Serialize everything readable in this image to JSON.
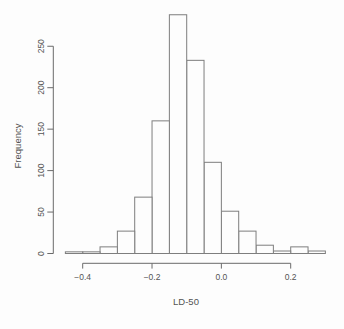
{
  "figure": {
    "background": "#fdfdfd",
    "axis_color": "#6a6a6a",
    "text_color": "#545454",
    "bar_fill": "#fdfdfd",
    "bar_stroke": "#7e7e7e"
  },
  "chart_data": {
    "type": "bar",
    "subtype": "histogram",
    "title": "",
    "xlabel": "LD-50",
    "ylabel": "Frequency",
    "bin_start": -0.45,
    "bin_width": 0.05,
    "bin_edges": [
      -0.45,
      -0.4,
      -0.35,
      -0.3,
      -0.25,
      -0.2,
      -0.15,
      -0.1,
      -0.05,
      0.0,
      0.05,
      0.1,
      0.15,
      0.2,
      0.25,
      0.3
    ],
    "counts": [
      2,
      2,
      8,
      27,
      68,
      160,
      288,
      233,
      110,
      51,
      27,
      10,
      3,
      8,
      3
    ],
    "x_ticks": [
      -0.4,
      -0.2,
      0.0,
      0.2
    ],
    "x_tick_labels": [
      "−0.4",
      "−0.2",
      "0.0",
      "0.2"
    ],
    "y_ticks": [
      0,
      50,
      100,
      150,
      200,
      250
    ],
    "y_tick_labels": [
      "0",
      "50",
      "100",
      "150",
      "200",
      "250"
    ],
    "xlim": [
      -0.45,
      0.3
    ],
    "ylim": [
      0,
      250
    ],
    "grid": false,
    "legend": null
  }
}
